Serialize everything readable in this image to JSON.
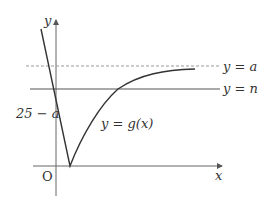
{
  "diagram": {
    "type": "function-graph",
    "axes": {
      "x_label": "x",
      "y_label": "y",
      "origin_label": "O"
    },
    "lines": {
      "dashed": {
        "label": "y = a",
        "style": "dashed"
      },
      "solid": {
        "label": "y = n",
        "style": "solid"
      }
    },
    "curve": {
      "label": "y = g(x)"
    },
    "y_intercept_label": "25 − a",
    "colors": {
      "axis": "#666666",
      "curve": "#333333",
      "dashed_line": "#999999",
      "solid_line": "#555555",
      "text": "#333333"
    }
  }
}
